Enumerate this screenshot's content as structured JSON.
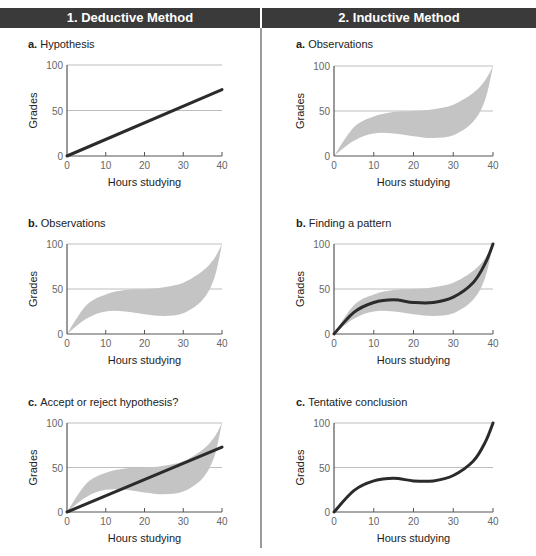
{
  "columns": [
    {
      "title": "1. Deductive Method",
      "panels": [
        {
          "letter": "a.",
          "label": "Hypothesis"
        },
        {
          "letter": "b.",
          "label": "Observations"
        },
        {
          "letter": "c.",
          "label": "Accept or reject hypothesis?"
        }
      ]
    },
    {
      "title": "2.  Inductive Method",
      "panels": [
        {
          "letter": "a.",
          "label": "Observations"
        },
        {
          "letter": "b.",
          "label": "Finding a pattern"
        },
        {
          "letter": "c.",
          "label": "Tentative conclusion"
        }
      ]
    }
  ],
  "axes": {
    "xlabel": "Hours studying",
    "ylabel": "Grades",
    "xticks": [
      0,
      10,
      20,
      30,
      40
    ],
    "yticks": [
      0,
      50,
      100
    ],
    "xlim": [
      0,
      40
    ],
    "ylim": [
      0,
      100
    ]
  },
  "colors": {
    "header_bg": "#3a3a3a",
    "band_fill": "#c4c4c4",
    "line": "#2b2b2b",
    "gridline": "#bdbdbd",
    "axis": "#555555"
  },
  "chart_data": [
    {
      "id": "deductive-a",
      "title": "a. Hypothesis",
      "type": "line",
      "xlabel": "Hours studying",
      "ylabel": "Grades",
      "xlim": [
        0,
        40
      ],
      "ylim": [
        0,
        100
      ],
      "series": [
        {
          "name": "hypothesis",
          "kind": "line",
          "x": [
            0,
            40
          ],
          "y": [
            0,
            73
          ]
        }
      ]
    },
    {
      "id": "deductive-b",
      "title": "b. Observations",
      "type": "area",
      "xlabel": "Hours studying",
      "ylabel": "Grades",
      "xlim": [
        0,
        40
      ],
      "ylim": [
        0,
        100
      ],
      "series": [
        {
          "name": "observations",
          "kind": "band",
          "x": [
            0,
            5,
            10,
            15,
            20,
            25,
            30,
            35,
            38,
            40
          ],
          "upper": [
            0,
            32,
            44,
            49,
            50,
            52,
            57,
            70,
            84,
            100
          ],
          "lower": [
            0,
            17,
            25,
            25,
            22,
            20,
            23,
            38,
            62,
            100
          ]
        }
      ]
    },
    {
      "id": "deductive-c",
      "title": "c. Accept or reject hypothesis?",
      "type": "area",
      "xlabel": "Hours studying",
      "ylabel": "Grades",
      "xlim": [
        0,
        40
      ],
      "ylim": [
        0,
        100
      ],
      "series": [
        {
          "name": "observations",
          "kind": "band",
          "x": [
            0,
            5,
            10,
            15,
            20,
            25,
            30,
            35,
            38,
            40
          ],
          "upper": [
            0,
            32,
            44,
            49,
            50,
            52,
            57,
            70,
            84,
            100
          ],
          "lower": [
            0,
            17,
            25,
            25,
            22,
            20,
            23,
            38,
            62,
            100
          ]
        },
        {
          "name": "hypothesis",
          "kind": "line",
          "x": [
            0,
            40
          ],
          "y": [
            0,
            73
          ]
        }
      ]
    },
    {
      "id": "inductive-a",
      "title": "a. Observations",
      "type": "area",
      "xlabel": "Hours studying",
      "ylabel": "Grades",
      "xlim": [
        0,
        40
      ],
      "ylim": [
        0,
        100
      ],
      "series": [
        {
          "name": "observations",
          "kind": "band",
          "x": [
            0,
            5,
            10,
            15,
            20,
            25,
            30,
            35,
            38,
            40
          ],
          "upper": [
            0,
            32,
            44,
            49,
            50,
            52,
            57,
            70,
            84,
            100
          ],
          "lower": [
            0,
            17,
            25,
            25,
            22,
            20,
            23,
            38,
            62,
            100
          ]
        }
      ]
    },
    {
      "id": "inductive-b",
      "title": "b. Finding a pattern",
      "type": "area",
      "xlabel": "Hours studying",
      "ylabel": "Grades",
      "xlim": [
        0,
        40
      ],
      "ylim": [
        0,
        100
      ],
      "series": [
        {
          "name": "observations",
          "kind": "band",
          "x": [
            0,
            5,
            10,
            15,
            20,
            25,
            30,
            35,
            38,
            40
          ],
          "upper": [
            0,
            32,
            44,
            49,
            50,
            52,
            57,
            70,
            84,
            100
          ],
          "lower": [
            0,
            17,
            25,
            25,
            22,
            20,
            23,
            38,
            62,
            100
          ]
        },
        {
          "name": "pattern",
          "kind": "curve",
          "x": [
            0,
            5,
            10,
            15,
            20,
            25,
            30,
            35,
            38,
            40
          ],
          "y": [
            0,
            24,
            35,
            38,
            35,
            35,
            41,
            57,
            78,
            100
          ]
        }
      ]
    },
    {
      "id": "inductive-c",
      "title": "c. Tentative conclusion",
      "type": "line",
      "xlabel": "Hours studying",
      "ylabel": "Grades",
      "xlim": [
        0,
        40
      ],
      "ylim": [
        0,
        100
      ],
      "series": [
        {
          "name": "conclusion",
          "kind": "curve",
          "x": [
            0,
            5,
            10,
            15,
            20,
            25,
            30,
            35,
            38,
            40
          ],
          "y": [
            0,
            24,
            35,
            38,
            35,
            35,
            41,
            57,
            78,
            100
          ]
        }
      ]
    }
  ]
}
